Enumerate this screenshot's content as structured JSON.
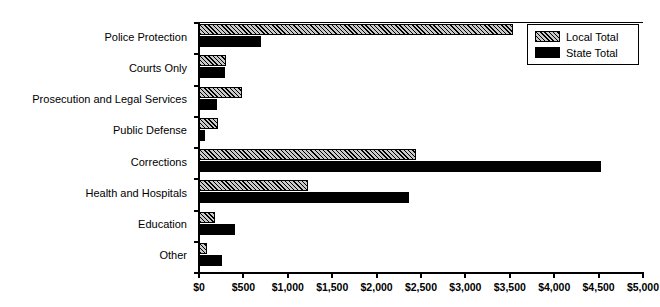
{
  "chart_data": {
    "type": "bar",
    "orientation": "horizontal",
    "title": "",
    "xlabel": "",
    "ylabel": "",
    "xlim": [
      0,
      5000
    ],
    "grid": false,
    "legend_position": "top-right",
    "categories": [
      "Police Protection",
      "Courts Only",
      "Prosecution and Legal Services",
      "Public Defense",
      "Corrections",
      "Health and Hospitals",
      "Education",
      "Other"
    ],
    "tick_labels": [
      "$0",
      "$500",
      "$1,000",
      "$1,500",
      "$2,000",
      "$2,500",
      "$3,000",
      "$3,500",
      "$4,000",
      "$4,500",
      "$5,000"
    ],
    "tick_values": [
      0,
      500,
      1000,
      1500,
      2000,
      2500,
      3000,
      3500,
      4000,
      4500,
      5000
    ],
    "series": [
      {
        "name": "Local Total",
        "pattern": "diagonal-hatch",
        "color": "#c9c9c9",
        "values": [
          3535,
          305,
          485,
          215,
          2445,
          1230,
          175,
          90
        ]
      },
      {
        "name": "State Total",
        "pattern": "solid",
        "color": "#000000",
        "values": [
          700,
          290,
          200,
          70,
          4530,
          2370,
          405,
          255
        ]
      }
    ]
  },
  "legend": {
    "items": [
      {
        "label": "Local Total"
      },
      {
        "label": "State Total"
      }
    ]
  }
}
